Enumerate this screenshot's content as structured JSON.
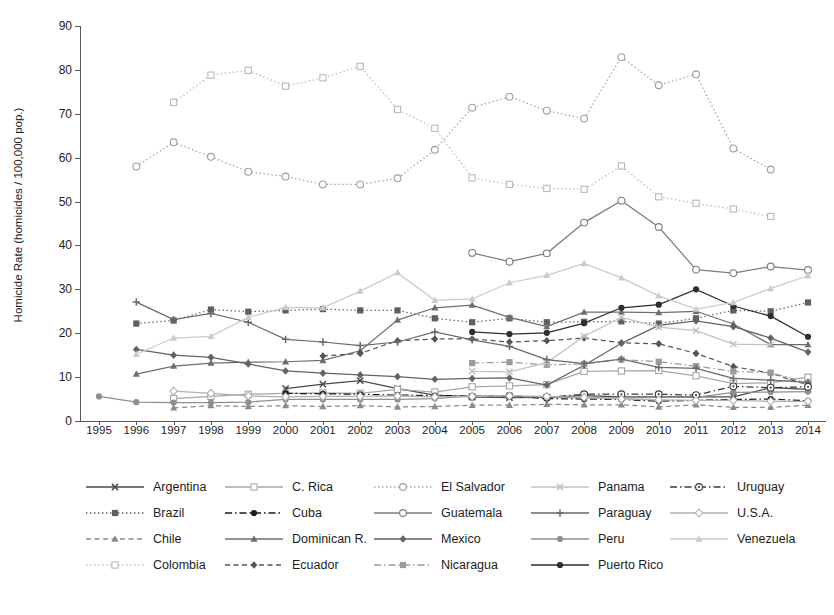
{
  "chart_data": {
    "type": "line",
    "title": "",
    "xlabel": "",
    "ylabel": "Homicide Rate (homicides / 100,000 pop.)",
    "xlim": [
      1995,
      2014
    ],
    "ylim": [
      0,
      90
    ],
    "ytick_step": 10,
    "grid": false,
    "legend_position": "bottom",
    "x": [
      1995,
      1996,
      1997,
      1998,
      1999,
      2000,
      2001,
      2002,
      2003,
      2004,
      2005,
      2006,
      2007,
      2008,
      2009,
      2010,
      2011,
      2012,
      2013,
      2014
    ],
    "yticks": [
      "0",
      "10",
      "20",
      "30",
      "40",
      "50",
      "60",
      "70",
      "80",
      "90"
    ],
    "xticks": [
      "1995",
      "1996",
      "1997",
      "1998",
      "1999",
      "2000",
      "2001",
      "2002",
      "2003",
      "2004",
      "2005",
      "2006",
      "2007",
      "2008",
      "2009",
      "2010",
      "2011",
      "2012",
      "2013",
      "2014"
    ],
    "series": [
      {
        "name": "Argentina",
        "marker": "x",
        "dash": "solid",
        "color": "#4a4a4a",
        "values": [
          null,
          null,
          null,
          null,
          null,
          7.4,
          8.4,
          9.2,
          7.4,
          5.9,
          5.5,
          5.3,
          5.4,
          5.8,
          5.5,
          5.5,
          5.5,
          5.5,
          7.6,
          7.2
        ]
      },
      {
        "name": "Brazil",
        "marker": "filled-square",
        "dash": "dotted",
        "color": "#5f5f5f",
        "values": [
          null,
          22.2,
          22.9,
          25.4,
          24.9,
          25.2,
          25.5,
          25.2,
          25.2,
          23.4,
          22.5,
          23.4,
          22.5,
          22.6,
          22.7,
          22.2,
          23.4,
          25.2,
          25.0,
          27.0
        ]
      },
      {
        "name": "Chile",
        "marker": "filled-triangle",
        "dash": "dashed",
        "color": "#8a8a8a",
        "values": [
          null,
          null,
          3.0,
          3.5,
          3.3,
          3.5,
          3.3,
          3.5,
          3.2,
          3.3,
          3.6,
          3.6,
          3.8,
          3.7,
          3.7,
          3.2,
          3.7,
          3.1,
          3.1,
          3.6
        ]
      },
      {
        "name": "Colombia",
        "marker": "open-square",
        "dash": "dotted",
        "color": "#b9b9b9",
        "values": [
          null,
          null,
          72.6,
          78.8,
          79.9,
          76.3,
          78.2,
          80.8,
          71.0,
          66.7,
          55.4,
          53.9,
          53.0,
          52.8,
          58.1,
          51.1,
          49.6,
          48.3,
          46.6,
          null
        ]
      },
      {
        "name": "C. Rica",
        "marker": "open-square",
        "dash": "solid",
        "color": "#a7a7a7",
        "values": [
          null,
          null,
          5.1,
          5.6,
          6.1,
          6.3,
          6.4,
          6.3,
          7.2,
          6.6,
          7.8,
          8.0,
          8.3,
          11.3,
          11.4,
          11.5,
          10.3,
          8.5,
          8.7,
          10.0
        ]
      },
      {
        "name": "Cuba",
        "marker": "filled-circle",
        "dash": "dashdot",
        "color": "#1a1a1a",
        "values": [
          null,
          null,
          null,
          null,
          null,
          6.3,
          6.2,
          6.1,
          5.9,
          5.8,
          5.7,
          5.6,
          5.1,
          5.0,
          4.9,
          4.5,
          4.7,
          4.9,
          5.0,
          4.6
        ]
      },
      {
        "name": "Dominican R.",
        "marker": "filled-triangle",
        "dash": "solid",
        "color": "#6e6e6e",
        "values": [
          null,
          10.7,
          12.5,
          13.2,
          13.4,
          13.5,
          13.8,
          16.0,
          23.0,
          25.8,
          26.4,
          23.6,
          21.5,
          24.8,
          24.8,
          24.7,
          25.0,
          22.1,
          17.4,
          17.4
        ]
      },
      {
        "name": "Ecuador",
        "marker": "filled-diamond",
        "dash": "dashed",
        "color": "#555555",
        "values": [
          null,
          null,
          null,
          null,
          null,
          null,
          14.8,
          15.4,
          18.3,
          18.7,
          18.7,
          18.0,
          18.3,
          18.9,
          17.8,
          17.6,
          15.4,
          12.4,
          10.9,
          8.2
        ]
      },
      {
        "name": "El Salvador",
        "marker": "open-circle",
        "dash": "dotted",
        "color": "#9e9e9e",
        "values": [
          null,
          58.0,
          63.5,
          60.2,
          56.8,
          55.7,
          53.9,
          53.9,
          55.3,
          61.8,
          71.4,
          73.9,
          70.7,
          68.9,
          82.9,
          76.5,
          79.0,
          62.1,
          57.3,
          null
        ]
      },
      {
        "name": "Guatemala",
        "marker": "open-circle",
        "dash": "solid",
        "color": "#7d7d7d",
        "values": [
          null,
          null,
          null,
          null,
          null,
          null,
          null,
          null,
          null,
          null,
          38.3,
          36.3,
          38.2,
          45.2,
          50.2,
          44.2,
          34.5,
          33.7,
          35.2,
          34.4
        ]
      },
      {
        "name": "Mexico",
        "marker": "filled-diamond",
        "dash": "solid",
        "color": "#636363",
        "values": [
          null,
          16.3,
          15.0,
          14.5,
          13.0,
          11.4,
          10.9,
          10.5,
          10.1,
          9.5,
          9.7,
          9.8,
          8.2,
          12.7,
          17.7,
          21.8,
          22.8,
          21.5,
          18.9,
          15.7
        ]
      },
      {
        "name": "Nicaragua",
        "marker": "filled-square",
        "dash": "dashdot",
        "color": "#9b9b9b",
        "values": [
          null,
          null,
          null,
          null,
          null,
          null,
          null,
          null,
          null,
          null,
          13.2,
          13.4,
          12.8,
          13.0,
          14.0,
          13.5,
          12.5,
          11.3,
          11.0,
          8.7
        ]
      },
      {
        "name": "Panama",
        "marker": "x",
        "dash": "solid",
        "color": "#c2c2c2",
        "values": [
          null,
          null,
          null,
          null,
          null,
          null,
          null,
          null,
          null,
          null,
          11.3,
          11.2,
          13.3,
          19.3,
          23.6,
          21.4,
          20.6,
          17.5,
          17.4,
          null
        ]
      },
      {
        "name": "Paraguay",
        "marker": "plus",
        "dash": "solid",
        "color": "#6a6a6a",
        "values": [
          null,
          27.1,
          23.1,
          24.5,
          22.5,
          18.6,
          18.0,
          17.2,
          18.0,
          20.3,
          18.5,
          17.0,
          14.0,
          13.1,
          14.1,
          12.2,
          12.0,
          9.7,
          9.3,
          8.8
        ]
      },
      {
        "name": "Peru",
        "marker": "filled-circle",
        "dash": "solid",
        "color": "#8f8f8f",
        "values": [
          5.6,
          4.3,
          4.2,
          4.2,
          4.3,
          4.9,
          4.9,
          4.9,
          4.9,
          5.1,
          5.7,
          5.6,
          5.4,
          5.3,
          5.2,
          5.4,
          5.4,
          6.5,
          6.6,
          6.7
        ]
      },
      {
        "name": "Puerto Rico",
        "marker": "filled-circle",
        "dash": "solid",
        "color": "#2e2e2e",
        "values": [
          null,
          null,
          null,
          null,
          null,
          null,
          null,
          null,
          null,
          null,
          20.3,
          19.8,
          20.1,
          22.3,
          25.8,
          26.5,
          30.0,
          26.2,
          23.9,
          19.2
        ]
      },
      {
        "name": "Uruguay",
        "marker": "circle-dot",
        "dash": "dashdot",
        "color": "#3a3a3a",
        "values": [
          null,
          null,
          null,
          null,
          null,
          null,
          null,
          null,
          null,
          null,
          5.5,
          5.7,
          5.4,
          6.1,
          6.1,
          6.1,
          5.9,
          7.9,
          7.6,
          7.8
        ]
      },
      {
        "name": "U.S.A.",
        "marker": "open-diamond",
        "dash": "solid",
        "color": "#b0b0b0",
        "values": [
          null,
          null,
          6.8,
          6.3,
          5.7,
          5.5,
          5.6,
          5.6,
          5.7,
          5.5,
          5.6,
          5.7,
          5.6,
          5.4,
          5.0,
          4.8,
          4.7,
          4.7,
          4.5,
          4.5
        ]
      },
      {
        "name": "Venezuela",
        "marker": "filled-triangle",
        "dash": "solid",
        "color": "#cbcbcb",
        "values": [
          null,
          15.2,
          18.9,
          19.3,
          23.6,
          25.9,
          25.8,
          29.6,
          33.8,
          27.5,
          27.8,
          31.5,
          33.2,
          35.9,
          32.6,
          28.5,
          25.5,
          27.0,
          30.2,
          33.1
        ]
      }
    ]
  },
  "legend": {
    "rows": [
      [
        {
          "name": "Argentina"
        },
        {
          "name": "C. Rica"
        },
        {
          "name": "El Salvador"
        },
        {
          "name": "Panama"
        },
        {
          "name": "Uruguay"
        }
      ],
      [
        {
          "name": "Brazil"
        },
        {
          "name": "Cuba"
        },
        {
          "name": "Guatemala"
        },
        {
          "name": "Paraguay"
        },
        {
          "name": "U.S.A."
        }
      ],
      [
        {
          "name": "Chile"
        },
        {
          "name": "Dominican R."
        },
        {
          "name": "Mexico"
        },
        {
          "name": "Peru"
        },
        {
          "name": "Venezuela"
        }
      ],
      [
        {
          "name": "Colombia"
        },
        {
          "name": "Ecuador"
        },
        {
          "name": "Nicaragua"
        },
        {
          "name": "Puerto Rico"
        }
      ]
    ]
  },
  "caption": {
    "text": ""
  }
}
